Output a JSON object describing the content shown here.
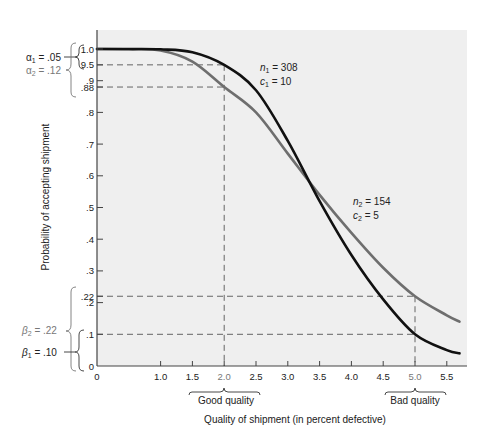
{
  "chart_data": {
    "type": "line",
    "title": "",
    "xlabel": "Quality of shipment (in percent defective)",
    "ylabel": "Probability of accepting shipment",
    "xlim": [
      0,
      5.8
    ],
    "ylim": [
      0,
      1.06
    ],
    "grid": false,
    "x_ticks": [
      {
        "value": 0,
        "label": "0"
      },
      {
        "value": 1.0,
        "label": "1.0"
      },
      {
        "value": 1.5,
        "label": "1.5"
      },
      {
        "value": 2.0,
        "label": "2.0",
        "style": "gray"
      },
      {
        "value": 2.5,
        "label": "2.5"
      },
      {
        "value": 3.0,
        "label": "3.0"
      },
      {
        "value": 3.5,
        "label": "3.5"
      },
      {
        "value": 4.0,
        "label": "4.0"
      },
      {
        "value": 4.5,
        "label": "4.5"
      },
      {
        "value": 5.0,
        "label": "5.0",
        "style": "gray"
      },
      {
        "value": 5.5,
        "label": "5.5"
      }
    ],
    "y_ticks": [
      {
        "value": 1.0,
        "label": "1.0"
      },
      {
        "value": 0.95,
        "label": "9.5"
      },
      {
        "value": 0.9,
        "label": ".9"
      },
      {
        "value": 0.88,
        "label": ".88"
      },
      {
        "value": 0.8,
        "label": ".8"
      },
      {
        "value": 0.7,
        "label": ".7"
      },
      {
        "value": 0.6,
        "label": ".6"
      },
      {
        "value": 0.5,
        "label": ".5"
      },
      {
        "value": 0.4,
        "label": ".4"
      },
      {
        "value": 0.3,
        "label": ".3"
      },
      {
        "value": 0.22,
        "label": ".22"
      },
      {
        "value": 0.2,
        "label": ".2"
      },
      {
        "value": 0.1,
        "label": ".1"
      },
      {
        "value": 0,
        "label": "0"
      }
    ],
    "x": [
      0,
      0.5,
      1.0,
      1.5,
      2.0,
      2.5,
      3.0,
      3.5,
      4.0,
      4.5,
      5.0,
      5.5,
      5.7
    ],
    "series": [
      {
        "name": "n1 = 308, c1 = 10",
        "color": "#111111",
        "values": [
          1.0,
          1.0,
          0.999,
          0.99,
          0.95,
          0.87,
          0.71,
          0.52,
          0.35,
          0.21,
          0.1,
          0.05,
          0.04
        ]
      },
      {
        "name": "n2 = 154, c2 = 5",
        "color": "#6e6e6e",
        "values": [
          1.0,
          0.999,
          0.995,
          0.96,
          0.88,
          0.8,
          0.67,
          0.54,
          0.42,
          0.31,
          0.22,
          0.16,
          0.14
        ]
      }
    ],
    "reference_lines": [
      {
        "type": "horizontal",
        "y": 0.95,
        "x_to": 2.0
      },
      {
        "type": "horizontal",
        "y": 0.88,
        "x_to": 2.0
      },
      {
        "type": "vertical",
        "x": 2.0,
        "y_from": 0.95
      },
      {
        "type": "horizontal",
        "y": 0.22,
        "x_to": 5.0
      },
      {
        "type": "horizontal",
        "y": 0.1,
        "x_to": 5.0
      },
      {
        "type": "vertical",
        "x": 5.0,
        "y_from": 0.22
      }
    ],
    "annotations": [
      {
        "text": "α1 = .05",
        "target": "bracket 1.0 to .95"
      },
      {
        "text": "α2 = .12",
        "target": "bracket 1.0 to .88"
      },
      {
        "text": "β2 = .22",
        "target": "bracket .22 to 0"
      },
      {
        "text": "β1 = .10",
        "target": "bracket .10 to 0"
      },
      {
        "text": "Good quality",
        "target": "x = 1.5 to 2.5"
      },
      {
        "text": "Bad quality",
        "target": "x = 4.5 to 5.5"
      }
    ]
  },
  "labels": {
    "curve1_n": "n",
    "curve1_n_sub": "1",
    "curve1_n_val": " = 308",
    "curve1_c": "c",
    "curve1_c_sub": "1",
    "curve1_c_val": " = 10",
    "curve2_n": "n",
    "curve2_n_sub": "2",
    "curve2_n_val": " = 154",
    "curve2_c": "c",
    "curve2_c_sub": "2",
    "curve2_c_val": " = 5",
    "alpha1": "α",
    "alpha1_sub": "1",
    "alpha1_val": " = .05",
    "alpha2": "α",
    "alpha2_sub": "2",
    "alpha2_val": " = .12",
    "beta2": "β",
    "beta2_sub": "2",
    "beta2_val": " = .22",
    "beta1": "β",
    "beta1_sub": "1",
    "beta1_val": " = .10",
    "good_quality": "Good quality",
    "bad_quality": "Bad quality"
  }
}
